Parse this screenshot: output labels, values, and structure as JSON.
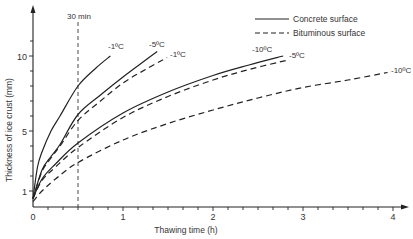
{
  "chart_data": {
    "type": "line",
    "title": "",
    "xlabel": "Thawing time (h)",
    "ylabel": "Thickness of ice crust (mm)",
    "xlim": [
      0,
      4.3
    ],
    "ylim": [
      0,
      12
    ],
    "xticks": [
      0,
      1,
      2,
      3,
      4
    ],
    "xtick_labels": [
      "0",
      "1",
      "2",
      "3",
      "4"
    ],
    "x_minor_step": 0.166667,
    "yticks": [
      1,
      5,
      10
    ],
    "ytick_labels": [
      "1",
      "5",
      "10"
    ],
    "y_minor_ticks": [
      2,
      3,
      4,
      6,
      7,
      8,
      9,
      11
    ],
    "grid": false,
    "reference_line": {
      "x": 0.5,
      "label": "30 min",
      "style": "dashed"
    },
    "legend": {
      "position": "top-right",
      "entries": [
        {
          "label": "Concrete surface",
          "style": "solid"
        },
        {
          "label": "Bituminous surface",
          "style": "dashed"
        }
      ]
    },
    "series": [
      {
        "name": "Concrete -1°C",
        "surface": "Concrete surface",
        "label": "-1ºC",
        "style": "solid",
        "x": [
          0,
          0.05,
          0.1,
          0.2,
          0.3,
          0.5,
          0.7,
          0.86
        ],
        "y": [
          0.5,
          2.6,
          3.6,
          5.0,
          6.0,
          8.0,
          9.2,
          10.0
        ]
      },
      {
        "name": "Concrete -5°C",
        "surface": "Concrete surface",
        "label": "-5ºC",
        "style": "solid",
        "x": [
          0,
          0.1,
          0.2,
          0.3,
          0.5,
          0.75,
          1.0,
          1.2,
          1.38
        ],
        "y": [
          0.5,
          2.4,
          3.3,
          4.1,
          6.1,
          7.4,
          8.6,
          9.5,
          10.3
        ]
      },
      {
        "name": "Bituminous -1°C",
        "surface": "Bituminous surface",
        "label": "-1ºC",
        "style": "dashed",
        "x": [
          0,
          0.1,
          0.2,
          0.3,
          0.5,
          0.75,
          1.0,
          1.25,
          1.49
        ],
        "y": [
          0.5,
          2.3,
          3.2,
          4.0,
          5.7,
          7.0,
          8.2,
          9.1,
          9.9
        ]
      },
      {
        "name": "Concrete -10°C",
        "surface": "Concrete surface",
        "label": "-10ºC",
        "style": "solid",
        "x": [
          0,
          0.1,
          0.25,
          0.5,
          1.0,
          1.5,
          2.0,
          2.4,
          2.78
        ],
        "y": [
          0.5,
          1.8,
          2.8,
          4.2,
          6.2,
          7.6,
          8.7,
          9.4,
          10.0
        ]
      },
      {
        "name": "Bituminous -5°C",
        "surface": "Bituminous surface",
        "label": "-5ºC",
        "style": "dashed",
        "x": [
          0,
          0.1,
          0.25,
          0.5,
          1.0,
          1.5,
          2.0,
          2.4,
          2.81
        ],
        "y": [
          0.5,
          1.7,
          2.6,
          3.9,
          5.9,
          7.3,
          8.4,
          9.1,
          9.7
        ]
      },
      {
        "name": "Bituminous -10°C",
        "surface": "Bituminous surface",
        "label": "-10ºC",
        "style": "dashed",
        "x": [
          0,
          0.1,
          0.25,
          0.5,
          1.0,
          1.5,
          2.0,
          2.5,
          3.0,
          3.5,
          3.94
        ],
        "y": [
          0.3,
          1.0,
          1.8,
          2.9,
          4.4,
          5.5,
          6.4,
          7.2,
          7.9,
          8.4,
          8.9
        ]
      }
    ]
  },
  "labels": {
    "ref_line": "30 min",
    "legend_concrete": "Concrete surface",
    "legend_bituminous": "Bituminous surface",
    "xlabel": "Thawing time (h)",
    "ylabel": "Thickness of ice crust (mm)",
    "curve_conc_m1": "-1ºC",
    "curve_conc_m5": "-5ºC",
    "curve_bit_m1": "-1ºC",
    "curve_conc_m10": "-10ºC",
    "curve_bit_m5": "-5ºC",
    "curve_bit_m10": "-10ºC",
    "xt0": "0",
    "xt1": "1",
    "xt2": "2",
    "xt3": "3",
    "xt4": "4",
    "yt1": "1",
    "yt5": "5",
    "yt10": "10"
  }
}
